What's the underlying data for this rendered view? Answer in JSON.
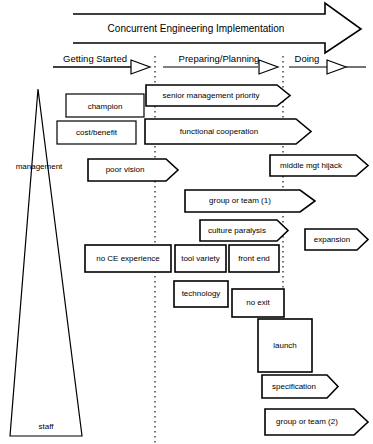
{
  "diagram": {
    "title": "Concurrent Engineering Implementation",
    "main_arrow": {
      "label": "Concurrent Engineering Implementation",
      "direction": "right"
    },
    "phases": [
      {
        "id": "getting-started",
        "label": "Getting Started"
      },
      {
        "id": "preparing-planning",
        "label": "Preparing/Planning"
      },
      {
        "id": "doing",
        "label": "Doing"
      }
    ],
    "pyramid": {
      "top_label": "management",
      "bottom_label": "staff"
    },
    "nodes": [
      {
        "id": "champion",
        "label": "champion",
        "shape": "rect"
      },
      {
        "id": "senior-management-priority",
        "label": "senior management  priority",
        "shape": "arrow"
      },
      {
        "id": "cost-benefit",
        "label": "cost/benefit",
        "shape": "rect"
      },
      {
        "id": "functional-cooperation",
        "label": "functional   cooperation",
        "shape": "arrow"
      },
      {
        "id": "poor-vision",
        "label": "poor vision",
        "shape": "arrow"
      },
      {
        "id": "middle-mgt-hijack",
        "label": "middle mgt  hijack",
        "shape": "arrow"
      },
      {
        "id": "group-or-team-1",
        "label": "group or team (1)",
        "shape": "arrow"
      },
      {
        "id": "culture-paralysis",
        "label": "culture paralysis",
        "shape": "arrow"
      },
      {
        "id": "expansion",
        "label": "expansion",
        "shape": "arrow"
      },
      {
        "id": "no-ce-experience",
        "label": "no CE experience",
        "shape": "rect"
      },
      {
        "id": "tool-variety",
        "label": "tool variety",
        "shape": "rect"
      },
      {
        "id": "front-end",
        "label": "front end",
        "shape": "rect"
      },
      {
        "id": "technology",
        "label": "technology",
        "shape": "rect"
      },
      {
        "id": "no-exit",
        "label": "no exit",
        "shape": "rect"
      },
      {
        "id": "launch",
        "label": "launch",
        "shape": "rect"
      },
      {
        "id": "specification",
        "label": "specification",
        "shape": "arrow"
      },
      {
        "id": "group-or-team-2",
        "label": "group or team (2)",
        "shape": "arrow"
      }
    ],
    "colors": {
      "stroke": "#000000",
      "fill": "#ffffff",
      "background": "#ffffff"
    }
  }
}
